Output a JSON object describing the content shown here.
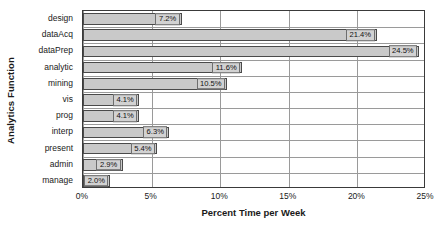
{
  "chart_data": {
    "type": "bar",
    "orientation": "horizontal",
    "title": "",
    "xlabel": "Percent Time per Week",
    "ylabel": "Analytics Function",
    "xlim": [
      0,
      25
    ],
    "xticks": [
      "0%",
      "5%",
      "10%",
      "15%",
      "20%",
      "25%"
    ],
    "xtick_values": [
      0,
      5,
      10,
      15,
      20,
      25
    ],
    "grid": true,
    "legend": "none",
    "categories": [
      "design",
      "dataAcq",
      "dataPrep",
      "analytic",
      "mining",
      "vis",
      "prog",
      "interp",
      "present",
      "admin",
      "manage"
    ],
    "values": [
      7.2,
      21.4,
      24.5,
      11.6,
      10.5,
      4.1,
      4.1,
      6.3,
      5.4,
      2.9,
      2.0
    ],
    "data_labels": [
      "7.2%",
      "21.4%",
      "24.5%",
      "11.6%",
      "10.5%",
      "4.1%",
      "4.1%",
      "6.3%",
      "5.4%",
      "2.9%",
      "2.0%"
    ],
    "colors": {
      "bar_fill": "#c9c9c9",
      "bar_border": "#4a4a4a",
      "label_box_fill": "#d2d2d2",
      "label_box_border": "#6e6e6e",
      "gridline": "#9a9a9a",
      "frame": "#3a3a3a",
      "text": "#1a1a1a",
      "background": "#ffffff"
    }
  }
}
